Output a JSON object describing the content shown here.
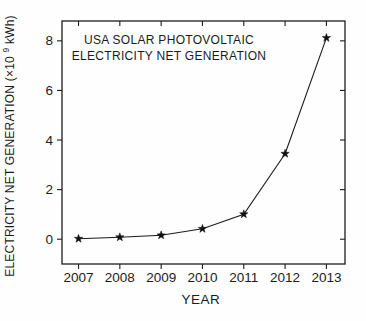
{
  "chart_data": {
    "type": "line",
    "title_lines": [
      "USA SOLAR PHOTOVOLTAIC",
      "ELECTRICITY NET GENERATION"
    ],
    "xlabel": "YEAR",
    "ylabel": "ELECTRICITY NET GENERATION (×10⁹ kWh)",
    "ylabel_parts": {
      "prefix": "ELECTRICITY NET GENERATION  (×10",
      "sup": "9",
      "suffix": " kWh)"
    },
    "x": [
      2007,
      2008,
      2009,
      2010,
      2011,
      2012,
      2013
    ],
    "series": [
      {
        "name": "USA solar photovoltaic electricity net generation",
        "values": [
          0.02,
          0.08,
          0.16,
          0.42,
          1.01,
          3.45,
          8.12
        ]
      }
    ],
    "x_ticks": [
      2007,
      2008,
      2009,
      2010,
      2011,
      2012,
      2013
    ],
    "y_ticks": [
      0,
      2,
      4,
      6,
      8
    ],
    "xlim": [
      2006.6,
      2013.45
    ],
    "ylim": [
      -1.0,
      8.8
    ],
    "grid": false,
    "legend_position": "none",
    "marker": "star-filled",
    "line_color": "#1c1c1c",
    "marker_color": "#111111",
    "axis_color": "#1c1c1c",
    "background_color": "#fefefe"
  }
}
